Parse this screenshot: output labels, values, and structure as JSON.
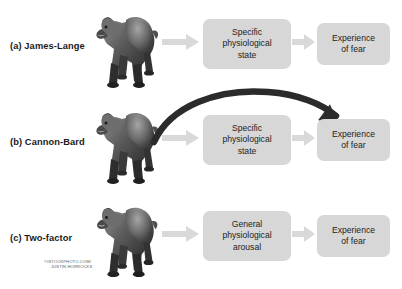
{
  "figure": {
    "background_color": "#ffffff",
    "box_color": "#d7d7d7",
    "arrow_color": "#d9d9d9",
    "curved_arrow_color": "#2b2b2b",
    "text_color": "#232323"
  },
  "rows": [
    {
      "label": "(a) James-Lange",
      "stimulus_icon": "bear-photo",
      "middle_box": "Specific physiological state",
      "middle_box_lines": [
        "Specific",
        "physiological",
        "state"
      ],
      "end_box": "Experience of fear",
      "end_box_lines": [
        "Experience",
        "of fear"
      ],
      "arrows": [
        "straight-gray-arrow",
        "straight-gray-arrow"
      ]
    },
    {
      "label": "(b) Cannon-Bard",
      "stimulus_icon": "bear-photo",
      "middle_box": "Specific physiological state",
      "middle_box_lines": [
        "Specific",
        "physiological",
        "state"
      ],
      "end_box": "Experience of fear",
      "end_box_lines": [
        "Experience",
        "of fear"
      ],
      "arrows": [
        "straight-gray-arrow",
        "curved-dark-arrow"
      ]
    },
    {
      "label": "(c) Two-factor",
      "stimulus_icon": "bear-photo",
      "middle_box": "General physiological arousal",
      "middle_box_lines": [
        "General",
        "physiological",
        "arousal"
      ],
      "end_box": "Experience of fear",
      "end_box_lines": [
        "Experience",
        "of fear"
      ],
      "arrows": [
        "straight-gray-arrow",
        "straight-gray-arrow"
      ]
    }
  ],
  "credit": {
    "line1": "©ISTOCKPHOTO.COM/",
    "line2": "JUSTIN HORROCKS"
  }
}
